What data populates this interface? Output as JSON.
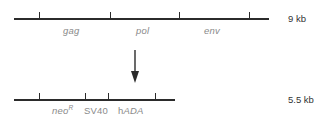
{
  "figure": {
    "name": "retroviral-vector-construct-diagram",
    "background_color": "#ffffff",
    "line_color": "#2b2b2b",
    "gene_label_color": "#8a8a8a",
    "size_label_color": "#333333"
  },
  "constructs": [
    {
      "id": "parental-retrovirus",
      "size_label": "9 kb",
      "line": {
        "x": 14,
        "y": 18,
        "width": 255
      },
      "ticks": [
        {
          "name": "tick-1",
          "x": 39
        },
        {
          "name": "tick-2",
          "x": 110
        },
        {
          "name": "tick-3",
          "x": 179
        },
        {
          "name": "tick-4",
          "x": 249
        }
      ],
      "genes": [
        {
          "name": "gag",
          "text": "gag",
          "style": "italic",
          "x": 63
        },
        {
          "name": "pol",
          "text": "pol",
          "style": "italic",
          "x": 136
        },
        {
          "name": "env",
          "text": "env",
          "style": "italic",
          "x": 204
        }
      ]
    },
    {
      "id": "recombinant-vector",
      "size_label": "5.5 kb",
      "line": {
        "x": 14,
        "y": 99,
        "width": 161
      },
      "ticks": [
        {
          "name": "tick-1",
          "x": 39
        },
        {
          "name": "tick-2",
          "x": 85
        },
        {
          "name": "tick-3",
          "x": 108
        },
        {
          "name": "tick-4",
          "x": 155
        }
      ],
      "genes": [
        {
          "name": "neo-r",
          "text": "neo",
          "superscript": "R",
          "style": "italic",
          "x": 52
        },
        {
          "name": "sv40",
          "text": "SV40",
          "style": "roman",
          "x": 84
        },
        {
          "name": "hada",
          "text_roman": "h",
          "text_italic": "ADA",
          "style": "mixed",
          "x": 118
        }
      ]
    }
  ],
  "arrow": {
    "name": "transformation-arrow",
    "direction": "down",
    "x": 128,
    "y": 50
  }
}
